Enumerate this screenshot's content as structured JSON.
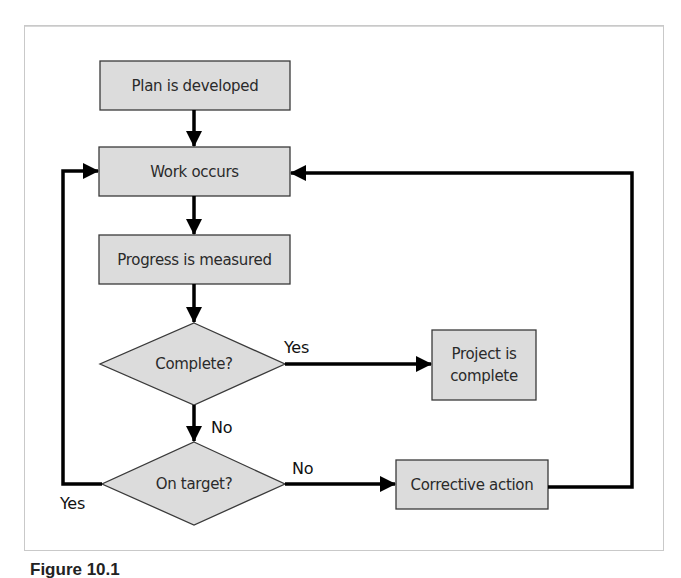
{
  "figure": {
    "caption_label": "Figure 10.1",
    "caption_text": "Control cycle"
  },
  "nodes": {
    "plan": {
      "label": "Plan is developed",
      "shape": "process"
    },
    "work": {
      "label": "Work occurs",
      "shape": "process"
    },
    "progress": {
      "label": "Progress is measured",
      "shape": "process"
    },
    "complete_q": {
      "label": "Complete?",
      "shape": "decision"
    },
    "project_complete": {
      "label": "Project is complete",
      "shape": "process"
    },
    "on_target_q": {
      "label": "On target?",
      "shape": "decision"
    },
    "corrective": {
      "label": "Corrective action",
      "shape": "process"
    }
  },
  "edges": [
    {
      "from": "plan",
      "to": "work",
      "label": ""
    },
    {
      "from": "work",
      "to": "progress",
      "label": ""
    },
    {
      "from": "progress",
      "to": "complete_q",
      "label": ""
    },
    {
      "from": "complete_q",
      "to": "project_complete",
      "label": "Yes"
    },
    {
      "from": "complete_q",
      "to": "on_target_q",
      "label": "No"
    },
    {
      "from": "on_target_q",
      "to": "work",
      "label": "Yes"
    },
    {
      "from": "on_target_q",
      "to": "corrective",
      "label": "No"
    },
    {
      "from": "corrective",
      "to": "work",
      "label": ""
    }
  ],
  "edge_labels": {
    "complete_yes": "Yes",
    "complete_no": "No",
    "on_target_yes": "Yes",
    "on_target_no": "No"
  },
  "colors": {
    "node_fill": "#dcdcdc",
    "node_stroke": "#3a3a3a",
    "arrow": "#000000",
    "frame_border": "#c9c9c9"
  }
}
